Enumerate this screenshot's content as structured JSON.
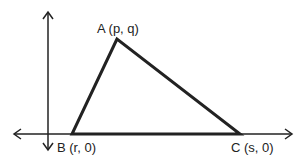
{
  "diagram": {
    "type": "coordinate-triangle",
    "points": {
      "A": {
        "label": "A (p, q)",
        "x": 117,
        "y": 39
      },
      "B": {
        "label": "B (r, 0)",
        "x": 72,
        "y": 134
      },
      "C": {
        "label": "C (s, 0)",
        "x": 240,
        "y": 134
      }
    },
    "axes": {
      "x_axis": {
        "y": 134,
        "from": 14,
        "to": 292,
        "arrows": "both"
      },
      "y_axis": {
        "x": 48,
        "from": 12,
        "to": 150,
        "arrows": "both"
      }
    },
    "colors": {
      "line": "#222222",
      "background": "#ffffff"
    }
  }
}
